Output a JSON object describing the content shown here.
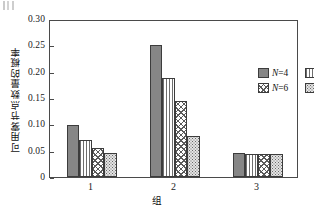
{
  "chart_data": {
    "type": "bar",
    "title": "",
    "subtitle": "",
    "xlabel": "组",
    "ylabel": "可用雾节点数量的概率",
    "categories": [
      "1",
      "2",
      "3"
    ],
    "ylim": [
      0,
      0.3
    ],
    "yticks": [
      "0",
      "0.05",
      "0.10",
      "0.15",
      "0.20",
      "0.25",
      "0.30"
    ],
    "ytick_values": [
      0,
      0.05,
      0.1,
      0.15,
      0.2,
      0.25,
      0.3
    ],
    "grid": false,
    "legend_position": "upper-right-inside",
    "series": [
      {
        "name": "N=4",
        "pattern": "solid",
        "values": [
          0.099,
          0.25,
          0.046
        ]
      },
      {
        "name": "N=5",
        "pattern": "vstripe",
        "values": [
          0.071,
          0.188,
          0.044
        ]
      },
      {
        "name": "N=6",
        "pattern": "cross",
        "values": [
          0.056,
          0.145,
          0.043
        ]
      },
      {
        "name": "N=10",
        "pattern": "dot",
        "values": [
          0.045,
          0.078,
          0.043
        ]
      }
    ]
  },
  "legend": {
    "entries": [
      {
        "label": "N=4",
        "symbol": "N",
        "value": "=4"
      },
      {
        "label": "N=5",
        "symbol": "N",
        "value": "=5"
      },
      {
        "label": "N=6",
        "symbol": "N",
        "value": "=6"
      },
      {
        "label": "N=10",
        "symbol": "N",
        "value": "=10"
      }
    ]
  },
  "colors": {
    "axis": "#4a4a4a",
    "bar_solid": "#868686",
    "bar_line": "#6e6e6e",
    "text": "#111111",
    "background": "#ffffff"
  }
}
